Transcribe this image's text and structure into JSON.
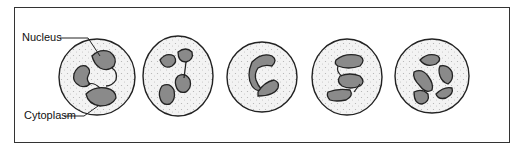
{
  "diagram": {
    "type": "labeled illustration",
    "labels": {
      "nucleus": "Nucleus",
      "cytoplasm": "Cytoplasm"
    },
    "cells": [
      {
        "index": 1,
        "nucleus_lobes": "multi-lobed (labeled example)"
      },
      {
        "index": 2,
        "nucleus_lobes": "4 lobes connected by strands"
      },
      {
        "index": 3,
        "nucleus_lobes": "2 lobes (band/C-shaped)"
      },
      {
        "index": 4,
        "nucleus_lobes": "3 lobes (S-shaped)"
      },
      {
        "index": 5,
        "nucleus_lobes": "5 lobes"
      }
    ],
    "colors": {
      "outline": "#222222",
      "nucleus_fill": "#8a8a8a",
      "cytoplasm_fill": "#f2f2f2",
      "granules": "#b5b5b5"
    }
  }
}
